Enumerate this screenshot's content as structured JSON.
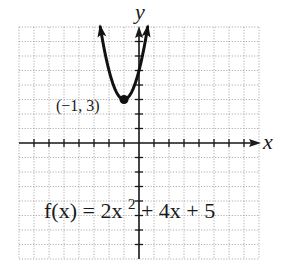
{
  "chart_data": {
    "type": "line",
    "title": "",
    "function": "f(x) = 2x^2 + 4x + 5",
    "equation_label": {
      "prefix": "f(x) = 2x",
      "exponent": "2",
      "suffix": " + 4x + 5"
    },
    "xlabel": "x",
    "ylabel": "y",
    "xlim": [
      -8,
      8
    ],
    "ylim": [
      -8,
      8
    ],
    "grid": true,
    "grid_step": 1,
    "tick_step": 1,
    "series": [
      {
        "name": "f(x) = 2x^2 + 4x + 5",
        "coefficients": {
          "a": 2,
          "b": 4,
          "c": 5
        },
        "x": [
          -2.58,
          -2.5,
          -2,
          -1.5,
          -1,
          -0.5,
          0,
          0.5,
          0.58
        ],
        "values": [
          8.0,
          7.5,
          5,
          3.5,
          3,
          3.5,
          5,
          7.5,
          8.0
        ],
        "arrows_at_ends": true
      }
    ],
    "annotations": [
      {
        "text": "(−1, 3)",
        "x": -1,
        "y": 3,
        "type": "vertex",
        "marker": "filled-circle"
      }
    ]
  },
  "colors": {
    "axis": "#1a1a1a",
    "curve": "#111111",
    "grid": "#9a9a9a",
    "background": "#ffffff"
  }
}
